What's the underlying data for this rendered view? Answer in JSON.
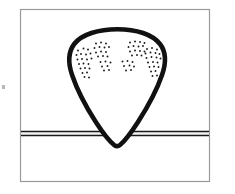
{
  "figure": {
    "domain": "diagram",
    "title": "",
    "caption": "",
    "canvas": {
      "width": 235,
      "height": 194,
      "background": "#ffffff"
    },
    "frame": {
      "name": "figure-border",
      "x": 20.5,
      "y": 9.5,
      "width": 189,
      "height": 172,
      "stroke": "#9a9a9a",
      "stroke_width": 1.2,
      "fill": "#ffffff"
    },
    "ground_line": {
      "name": "substrate-double-line",
      "label": "",
      "stroke": "#1a1a1a",
      "x_start": 21,
      "x_end": 209,
      "y_top": 131.6,
      "y_bottom": 135.4,
      "stroke_width": 1.5,
      "gap_fill": "#f2f2f2"
    },
    "blob": {
      "name": "teardrop-outline",
      "label": "",
      "stroke": "#111111",
      "stroke_width": 4.6,
      "fill": "#ffffff",
      "apex_y": 29,
      "tip_y": 147,
      "left_x": 72,
      "right_x": 164,
      "path": "M 117.5 29.2 C 136.5 29.2 152.5 34.4 160.0 44.0 C 167.0 53.0 166.0 63.5 162.0 75.0 C 157.0 89.5 147.0 108.0 138.0 122.0 C 131.5 132.0 125.0 141.0 120.0 145.0 C 118.2 146.5 116.2 146.6 114.4 145.2 C 109.2 141.2 102.4 132.2 95.8 122.0 C 86.6 107.8 76.8 89.2 72.0 74.8 C 68.2 63.4 67.4 53.0 74.2 44.0 C 81.6 34.3 98.4 29.2 117.5 29.2 Z"
    },
    "stipple": {
      "name": "stipple-dot-field",
      "label": "",
      "dot_color": "#1a1a1a",
      "dot_radius": 0.95,
      "cluster_count": 6,
      "total_dots": 118,
      "clusters": [
        {
          "name": "cluster-far-left",
          "cx": 84,
          "cy": 62,
          "dots": [
            [
              78.0,
              50.5
            ],
            [
              83.5,
              48.5
            ],
            [
              88.0,
              49.5
            ],
            [
              76.5,
              55.0
            ],
            [
              81.0,
              54.0
            ],
            [
              86.0,
              54.5
            ],
            [
              90.5,
              53.5
            ],
            [
              77.5,
              59.5
            ],
            [
              82.0,
              59.0
            ],
            [
              87.0,
              59.5
            ],
            [
              91.5,
              58.5
            ],
            [
              79.0,
              64.0
            ],
            [
              83.5,
              63.5
            ],
            [
              88.5,
              64.0
            ],
            [
              80.5,
              68.5
            ],
            [
              85.0,
              68.0
            ],
            [
              89.5,
              68.5
            ],
            [
              82.5,
              73.0
            ],
            [
              87.0,
              72.5
            ],
            [
              84.5,
              77.0
            ],
            [
              89.0,
              77.5
            ]
          ]
        },
        {
          "name": "cluster-left-inner",
          "cx": 101,
          "cy": 50,
          "dots": [
            [
              96.0,
              43.5
            ],
            [
              101.0,
              42.5
            ],
            [
              106.0,
              43.5
            ],
            [
              94.5,
              48.0
            ],
            [
              99.5,
              47.0
            ],
            [
              104.5,
              47.5
            ],
            [
              109.0,
              47.0
            ],
            [
              96.0,
              52.5
            ],
            [
              101.0,
              51.5
            ],
            [
              106.0,
              52.0
            ],
            [
              98.0,
              56.5
            ],
            [
              103.0,
              56.0
            ],
            [
              107.5,
              56.5
            ]
          ]
        },
        {
          "name": "cluster-center-left-sparse",
          "cx": 106,
          "cy": 66,
          "dots": [
            [
              100.5,
              62.0
            ],
            [
              105.5,
              61.5
            ],
            [
              110.5,
              62.5
            ],
            [
              102.0,
              66.5
            ],
            [
              107.5,
              66.0
            ],
            [
              104.0,
              70.5
            ],
            [
              109.0,
              70.0
            ]
          ]
        },
        {
          "name": "cluster-center-right-sparse",
          "cx": 128,
          "cy": 66,
          "dots": [
            [
              122.5,
              61.5
            ],
            [
              127.5,
              61.0
            ],
            [
              132.5,
              62.0
            ],
            [
              124.0,
              66.0
            ],
            [
              129.5,
              65.5
            ],
            [
              134.0,
              66.5
            ],
            [
              126.0,
              70.5
            ],
            [
              131.0,
              70.0
            ]
          ]
        },
        {
          "name": "cluster-right-inner",
          "cx": 137,
          "cy": 49,
          "dots": [
            [
              130.0,
              42.5
            ],
            [
              135.0,
              41.5
            ],
            [
              140.0,
              42.0
            ],
            [
              144.5,
              43.0
            ],
            [
              128.5,
              47.0
            ],
            [
              133.5,
              46.0
            ],
            [
              138.5,
              46.5
            ],
            [
              143.0,
              46.0
            ],
            [
              130.0,
              51.5
            ],
            [
              135.0,
              50.5
            ],
            [
              140.0,
              51.0
            ],
            [
              144.5,
              51.5
            ],
            [
              132.0,
              55.5
            ],
            [
              137.0,
              55.0
            ],
            [
              141.5,
              55.5
            ]
          ]
        },
        {
          "name": "cluster-far-right",
          "cx": 152,
          "cy": 63,
          "dots": [
            [
              147.0,
              49.0
            ],
            [
              152.0,
              48.0
            ],
            [
              157.0,
              49.5
            ],
            [
              145.5,
              53.5
            ],
            [
              150.5,
              52.5
            ],
            [
              155.5,
              53.0
            ],
            [
              159.5,
              54.0
            ],
            [
              146.5,
              58.0
            ],
            [
              151.5,
              57.0
            ],
            [
              156.5,
              57.5
            ],
            [
              160.5,
              58.5
            ],
            [
              148.0,
              62.5
            ],
            [
              153.0,
              62.0
            ],
            [
              157.5,
              62.5
            ],
            [
              149.5,
              67.0
            ],
            [
              154.0,
              66.5
            ],
            [
              158.5,
              67.0
            ],
            [
              151.0,
              71.5
            ],
            [
              155.5,
              71.0
            ],
            [
              152.5,
              76.0
            ],
            [
              157.0,
              75.5
            ]
          ]
        }
      ]
    },
    "margin_mark": {
      "name": "left-margin-artifact",
      "x": 2,
      "y": 85,
      "width": 3,
      "height": 4,
      "color": "#b8b8b8"
    }
  }
}
